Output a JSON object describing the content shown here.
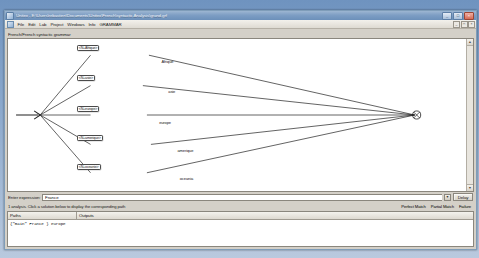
{
  "window": {
    "title": "Unitex - E:\\Users\\rebastien\\Documents\\Unitex\\French\\syntactic Analysis\\grand.grf",
    "app_icon": "unitex-icon",
    "minimize_label": "_",
    "maximize_label": "□",
    "close_label": "×"
  },
  "menubar": {
    "icon": "document-icon",
    "items": [
      {
        "label": "File"
      },
      {
        "label": "Edit"
      },
      {
        "label": "Lab"
      },
      {
        "label": "Project"
      },
      {
        "label": "Windows"
      },
      {
        "label": "Info"
      },
      {
        "label": "GRAMMAR"
      }
    ],
    "mdi_controls": [
      {
        "name": "mdi-minimize",
        "label": "_"
      },
      {
        "name": "mdi-restore",
        "label": "□"
      },
      {
        "name": "mdi-close",
        "label": "×"
      }
    ]
  },
  "document": {
    "grammar_title": "French/French syntactic grammar"
  },
  "graph": {
    "nodes": [
      {
        "id": "n1",
        "label": "<N+Afrique>"
      },
      {
        "id": "n2",
        "label": "<N+asie>"
      },
      {
        "id": "n3",
        "label": "<N+europe>"
      },
      {
        "id": "n4",
        "label": "<N+amerique>"
      },
      {
        "id": "n5",
        "label": "<N+oceanie>"
      }
    ],
    "outputs": [
      {
        "id": "o1",
        "label": "Afrique"
      },
      {
        "id": "o2",
        "label": "asie"
      },
      {
        "id": "o3",
        "label": "europe"
      },
      {
        "id": "o4",
        "label": "amerique"
      },
      {
        "id": "o5",
        "label": "oceania"
      }
    ],
    "entry_node": "initial-state",
    "exit_node": "final-state"
  },
  "expression_bar": {
    "label": "Enter expression:",
    "value": "France",
    "placeholder": "",
    "dropdown_icon": "chevron-down-icon",
    "button_label": "Delay"
  },
  "status": {
    "message": "1 analysis. Click a solution below to display the corresponding path",
    "legend": [
      {
        "label": "Perfect Match",
        "color": "#000000"
      },
      {
        "label": "Partial Match",
        "color": "#000000"
      },
      {
        "label": "Failure",
        "color": "#000000"
      }
    ]
  },
  "results": {
    "columns": [
      "Paths",
      "Outputs"
    ],
    "rows": [
      {
        "path": "{\"main\" France } europe",
        "output": ""
      }
    ]
  },
  "scrollbar": {
    "up_arrow": "▲",
    "down_arrow": "▼"
  }
}
